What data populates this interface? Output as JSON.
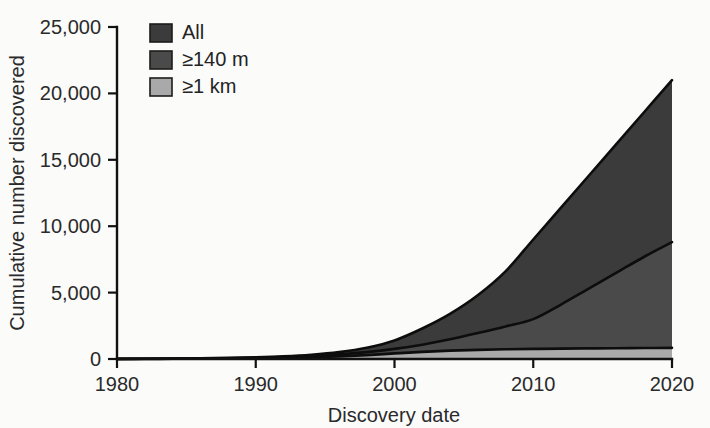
{
  "figure": {
    "background_color": "#fbfbfa",
    "plot_left_px": 117,
    "plot_right_px": 672,
    "plot_bottom_px": 359,
    "plot_top_px": 27
  },
  "chart_data": {
    "type": "area",
    "title": "",
    "subtitle": "",
    "xlabel": "Discovery date",
    "ylabel": "Cumulative number discovered",
    "xlim": [
      1980,
      2020
    ],
    "ylim": [
      0,
      25000
    ],
    "xticks": [
      1980,
      1990,
      2000,
      2010,
      2020
    ],
    "xtick_labels": [
      "1980",
      "1990",
      "2000",
      "2010",
      "2020"
    ],
    "yticks": [
      0,
      5000,
      10000,
      15000,
      20000,
      25000
    ],
    "ytick_labels": [
      "0",
      "5,000",
      "10,000",
      "15,000",
      "20,000",
      "25,000"
    ],
    "grid": false,
    "legend_position": "top-left",
    "x": [
      1980,
      1982,
      1984,
      1986,
      1988,
      1990,
      1992,
      1994,
      1996,
      1998,
      2000,
      2002,
      2004,
      2006,
      2008,
      2010,
      2012,
      2014,
      2016,
      2018,
      2020
    ],
    "series": [
      {
        "name": "All",
        "color": "#3b3b3b",
        "values": [
          10,
          20,
          35,
          55,
          85,
          130,
          200,
          320,
          520,
          850,
          1400,
          2300,
          3400,
          4800,
          6600,
          9000,
          11400,
          13800,
          16200,
          18600,
          21000
        ]
      },
      {
        "name": "≥140 m",
        "color": "#4a4a4a",
        "values": [
          8,
          15,
          25,
          40,
          62,
          95,
          145,
          225,
          350,
          520,
          760,
          1080,
          1480,
          1950,
          2450,
          3000,
          4100,
          5300,
          6500,
          7700,
          8800
        ]
      },
      {
        "name": "≥1 km",
        "color": "#a9a9a9",
        "values": [
          5,
          10,
          16,
          25,
          38,
          58,
          88,
          130,
          195,
          290,
          420,
          540,
          630,
          690,
          730,
          760,
          785,
          800,
          815,
          825,
          840
        ]
      }
    ]
  },
  "legend": {
    "entries": [
      {
        "label": "All",
        "color": "#3b3b3b"
      },
      {
        "label": "≥140 m",
        "color": "#4a4a4a"
      },
      {
        "label": "≥1 km",
        "color": "#a9a9a9"
      }
    ]
  }
}
